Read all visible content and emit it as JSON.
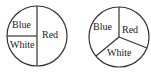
{
  "spinners": [
    {
      "id": "spinner-1",
      "center": [
        37,
        36
      ],
      "radius": 30,
      "sectors": [
        {
          "label": "Blue",
          "fraction": 0.25,
          "label_pos": [
            12,
            28
          ]
        },
        {
          "label": "White",
          "fraction": 0.25,
          "label_pos": [
            10,
            48
          ]
        },
        {
          "label": "Red",
          "fraction": 0.5,
          "label_pos": [
            42,
            38
          ]
        }
      ]
    },
    {
      "id": "spinner-2",
      "center": [
        119,
        37
      ],
      "radius": 30,
      "sectors": [
        {
          "label": "Blue",
          "fraction": 0.3333,
          "label_pos": [
            93,
            30
          ]
        },
        {
          "label": "Red",
          "fraction": 0.3333,
          "label_pos": [
            121,
            33
          ]
        },
        {
          "label": "White",
          "fraction": 0.3333,
          "label_pos": [
            107,
            55
          ]
        }
      ]
    }
  ],
  "colors": {
    "stroke": "#333333",
    "text": "#222222",
    "background": "#ffffff"
  }
}
